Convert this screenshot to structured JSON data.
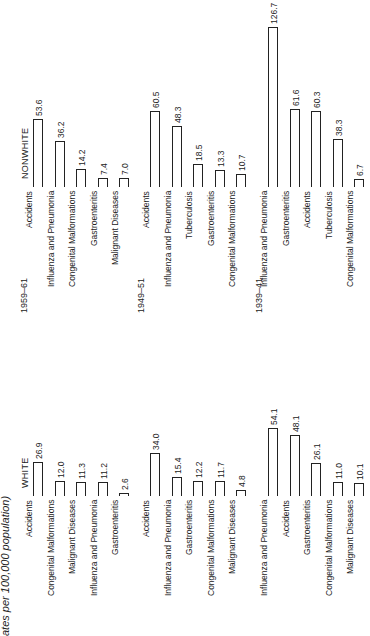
{
  "chart_data": {
    "type": "bar",
    "title_visible": "ates per 100,000 population)",
    "orientation": "rotated -90deg; bars grow upward in image, text reads bottom-to-top",
    "groups": [
      {
        "name": "NONWHITE",
        "periods": [
          {
            "period": "1959–61",
            "categories": [
              "Accidents",
              "Influenza and Pneumonia",
              "Congenital Malformations",
              "Gastroenteritis",
              "Malignant Diseases"
            ],
            "values": [
              53.6,
              36.2,
              14.2,
              7.4,
              7.0
            ]
          },
          {
            "period": "1949–51",
            "categories": [
              "Accidents",
              "Influenza and Pneumonia",
              "Tuberculosis",
              "Gastroenteritis",
              "Congenital Malformations"
            ],
            "values": [
              60.5,
              48.3,
              18.5,
              13.3,
              10.7
            ]
          },
          {
            "period": "1939–41",
            "categories": [
              "Influenza and Pneumonia",
              "Gastroenteritis",
              "Accidents",
              "Tuberculosis",
              "Congenital Malformations"
            ],
            "values": [
              126.7,
              61.6,
              60.3,
              38.3,
              6.7
            ]
          }
        ]
      },
      {
        "name": "WHITE",
        "periods": [
          {
            "period": "1959–61",
            "categories": [
              "Accidents",
              "Congenital Malformations",
              "Malignant Diseases",
              "Influenza and Pneumonia",
              "Gastroenteritis"
            ],
            "values": [
              26.9,
              12.0,
              11.3,
              11.2,
              2.6
            ]
          },
          {
            "period": "1949–51",
            "categories": [
              "Accidents",
              "Influenza and Pneumonia",
              "Gastroenteritis",
              "Congenital Malformations",
              "Malignant Diseases"
            ],
            "values": [
              34.0,
              15.4,
              12.2,
              11.7,
              4.8
            ]
          },
          {
            "period": "1939–41",
            "categories": [
              "Influenza and Pneumonia",
              "Accidents",
              "Gastroenteritis",
              "Congenital Malformations",
              "Malignant Diseases"
            ],
            "values": [
              54.1,
              48.1,
              26.1,
              11.0,
              10.1
            ]
          }
        ]
      }
    ],
    "grid": false,
    "legend": false
  }
}
